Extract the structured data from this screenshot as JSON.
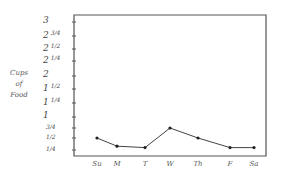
{
  "chart_data": {
    "type": "line",
    "title": "",
    "xlabel": "",
    "ylabel": "Cups of Food",
    "categories": [
      "Su",
      "M",
      "T",
      "W",
      "Th",
      "F",
      "Sa"
    ],
    "series": [
      {
        "name": "Cups of Food",
        "values": [
          0.5,
          0.33,
          0.3,
          0.75,
          0.5,
          0.3,
          0.3
        ]
      }
    ],
    "ylim": [
      0,
      3
    ],
    "y_ticks": [
      {
        "whole": "3",
        "frac": "",
        "value": 3
      },
      {
        "whole": "2",
        "frac": "3/4",
        "value": 2.75
      },
      {
        "whole": "2",
        "frac": "1/2",
        "value": 2.5
      },
      {
        "whole": "2",
        "frac": "1/4",
        "value": 2.25
      },
      {
        "whole": "2",
        "frac": "",
        "value": 2
      },
      {
        "whole": "1",
        "frac": "1/2",
        "value": 1.5
      },
      {
        "whole": "1",
        "frac": "1/4",
        "value": 1.25
      },
      {
        "whole": "1",
        "frac": "",
        "value": 1
      },
      {
        "whole": "",
        "frac": "3/4",
        "value": 0.75
      },
      {
        "whole": "",
        "frac": "1/2",
        "value": 0.5
      },
      {
        "whole": "",
        "frac": "1/4",
        "value": 0.25
      }
    ],
    "grid": false,
    "legend": "none"
  },
  "axis": {
    "ylabel_lines": [
      "Cups",
      "of",
      "Food"
    ],
    "x_labels": [
      "Su",
      "M",
      "T",
      "W",
      "Th",
      "F",
      "Sa"
    ]
  },
  "colors": {
    "line": "#444444",
    "frame": "#555555",
    "marker": "#222222"
  }
}
